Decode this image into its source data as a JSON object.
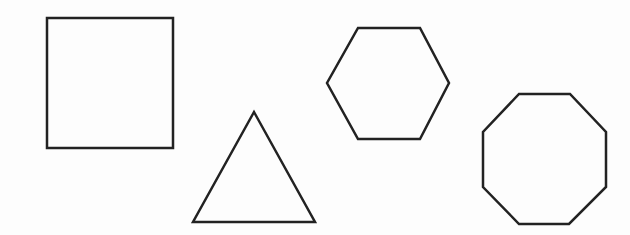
{
  "diagram": {
    "background": "#fdfdfd",
    "stroke_color": "#222222",
    "stroke_width": 2.5,
    "shapes": [
      {
        "name": "square",
        "sides": 4,
        "points": "47,18 173,18 173,148 47,148"
      },
      {
        "name": "triangle",
        "sides": 3,
        "points": "254,112 315,222 193,222"
      },
      {
        "name": "hexagon",
        "sides": 6,
        "points": "358,28 420,28 449,83 420,139 358,139 327,83"
      },
      {
        "name": "octagon",
        "sides": 8,
        "points": "519,94 570,94 606,132 606,187 569,224 519,224 483,187 483,132"
      }
    ]
  }
}
